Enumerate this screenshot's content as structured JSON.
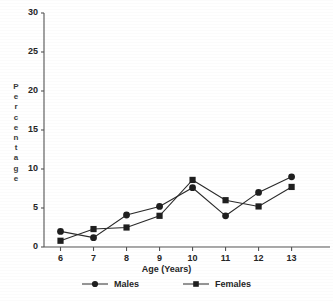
{
  "chart_data": {
    "type": "line",
    "title": "",
    "xlabel": "Age (Years)",
    "ylabel": "Percentage",
    "categories": [
      6,
      7,
      8,
      9,
      10,
      11,
      12,
      13
    ],
    "xlim": [
      5.5,
      13.8
    ],
    "ylim": [
      0,
      30
    ],
    "ytick_step": 5,
    "grid": false,
    "legend_position": "bottom",
    "series": [
      {
        "name": "Males",
        "marker": "circle",
        "color": "#1f1f1f",
        "values": [
          2.0,
          1.2,
          4.1,
          5.2,
          7.6,
          4.0,
          7.0,
          9.0
        ]
      },
      {
        "name": "Females",
        "marker": "square",
        "color": "#1f1f1f",
        "values": [
          0.8,
          2.3,
          2.5,
          4.0,
          8.6,
          6.0,
          5.2,
          7.7
        ]
      }
    ]
  },
  "axes": {
    "y_ticks": [
      "30",
      "25",
      "20",
      "15",
      "10",
      "5",
      "0"
    ],
    "x_ticks": [
      "6",
      "7",
      "8",
      "9",
      "10",
      "11",
      "12",
      "13"
    ],
    "y_label_letters": [
      "P",
      "e",
      "r",
      "c",
      "e",
      "n",
      "t",
      "a",
      "g",
      "e"
    ],
    "x_label": "Age (Years)"
  },
  "legend": {
    "items": [
      {
        "label": "Males",
        "marker": "circle-marker"
      },
      {
        "label": "Females",
        "marker": "square-marker"
      }
    ]
  },
  "colors": {
    "axis": "#555555",
    "series_line": "#2a2a2a",
    "marker_fill": "#1f1f1f",
    "background": "#ffffff"
  }
}
